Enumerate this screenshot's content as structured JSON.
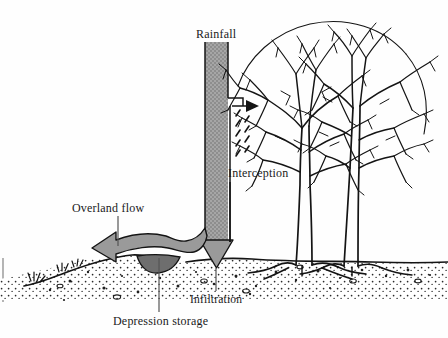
{
  "figure": {
    "kind": "hydrologic-cycle-cross-section",
    "title_visible": false,
    "background_color": "#fefefe",
    "ink_color": "#1a1a1a"
  },
  "labels": {
    "rainfall": "Rainfall",
    "interception": "Interception",
    "overland_flow": "Overland flow",
    "infiltration": "Infiltration",
    "depression_storage": "Depression storage"
  },
  "elements": {
    "rainfall_column": {
      "name": "rainfall-band",
      "fill": "#9a9a9a",
      "outline": "#1a1a1a",
      "orientation": "vertical",
      "from_y": 42,
      "to_y": 258
    },
    "interception_arrow": {
      "name": "interception-arrow",
      "direction": "right",
      "color": "#1a1a1a",
      "target": "tree-canopy"
    },
    "overland_flow_arrow": {
      "name": "overland-flow-arrow",
      "direction": "left",
      "fill": "#9a9a9a",
      "outline": "#1a1a1a"
    },
    "infiltration_arrow": {
      "name": "infiltration-arrow",
      "direction": "down",
      "fill": "#9a9a9a",
      "outline": "#1a1a1a"
    },
    "depression_pool": {
      "name": "depression-storage-pool",
      "fill": "#6e6e6e"
    },
    "ground": {
      "name": "ground-surface",
      "soil_texture": "stippled",
      "slope": "down-to-the-left"
    },
    "trees": {
      "name": "bare-deciduous-trees",
      "count": 2,
      "foliage": "bare-branches"
    }
  },
  "colors": {
    "gray_fill": "#9a9a9a",
    "dark_pool": "#6e6e6e",
    "ink": "#1a1a1a",
    "paper": "#fefefe"
  }
}
